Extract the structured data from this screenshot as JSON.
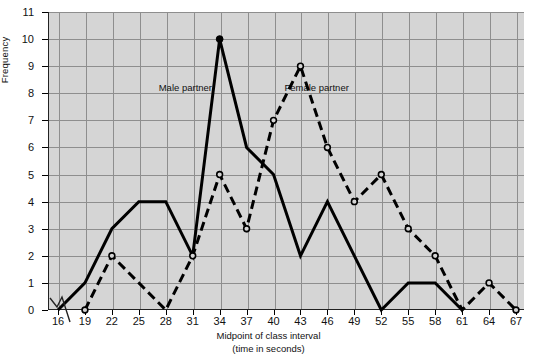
{
  "chart_data": {
    "type": "line",
    "title": "",
    "xlabel": "Midpoint of class interval",
    "xlabel_line2": "(time in seconds)",
    "ylabel": "Frequency",
    "grid": true,
    "legend_position": "inline-annotations",
    "axis_break": true,
    "xlim": [
      16,
      67
    ],
    "ylim": [
      0,
      11
    ],
    "xticks": [
      16,
      19,
      22,
      25,
      28,
      31,
      34,
      37,
      40,
      43,
      46,
      49,
      52,
      55,
      58,
      61,
      64,
      67
    ],
    "yticks": [
      0,
      1,
      2,
      3,
      4,
      5,
      6,
      7,
      8,
      9,
      10,
      11
    ],
    "categories": [
      16,
      19,
      22,
      25,
      28,
      31,
      34,
      37,
      40,
      43,
      46,
      49,
      52,
      55,
      58,
      61,
      64,
      67
    ],
    "series": [
      {
        "name": "Male partner",
        "style": "solid",
        "marker": "filled-circle",
        "color": "#000000",
        "x": [
          16,
          19,
          22,
          25,
          28,
          31,
          34,
          37,
          40,
          43,
          46,
          49,
          52,
          55,
          58,
          61
        ],
        "values": [
          0,
          1,
          3,
          4,
          4,
          2,
          10,
          6,
          5,
          2,
          4,
          2,
          0,
          1,
          1,
          0
        ]
      },
      {
        "name": "Female partner",
        "style": "dashed",
        "marker": "open-circle",
        "color": "#000000",
        "x": [
          19,
          22,
          25,
          28,
          31,
          34,
          37,
          40,
          43,
          46,
          49,
          52,
          55,
          58,
          61,
          64,
          67
        ],
        "values": [
          0,
          2,
          1,
          0,
          2,
          5,
          3,
          7,
          9,
          6,
          4,
          5,
          3,
          2,
          0,
          1,
          0
        ]
      }
    ],
    "annotations": [
      {
        "text": "Male partner",
        "x": 31,
        "y": 8.2
      },
      {
        "text": "Female partner",
        "x": 45,
        "y": 8.2
      }
    ]
  },
  "axis": {
    "y_label": "Frequency",
    "x_title": "Midpoint of class interval",
    "x_subtitle": "(time in seconds)"
  },
  "labels": {
    "male": "Male partner",
    "female": "Female partner"
  },
  "colors": {
    "plot_background": "#d5d5d5",
    "gridline": "#8e8e8e",
    "axis": "#222222",
    "series": "#000000",
    "page_background": "#ffffff"
  }
}
